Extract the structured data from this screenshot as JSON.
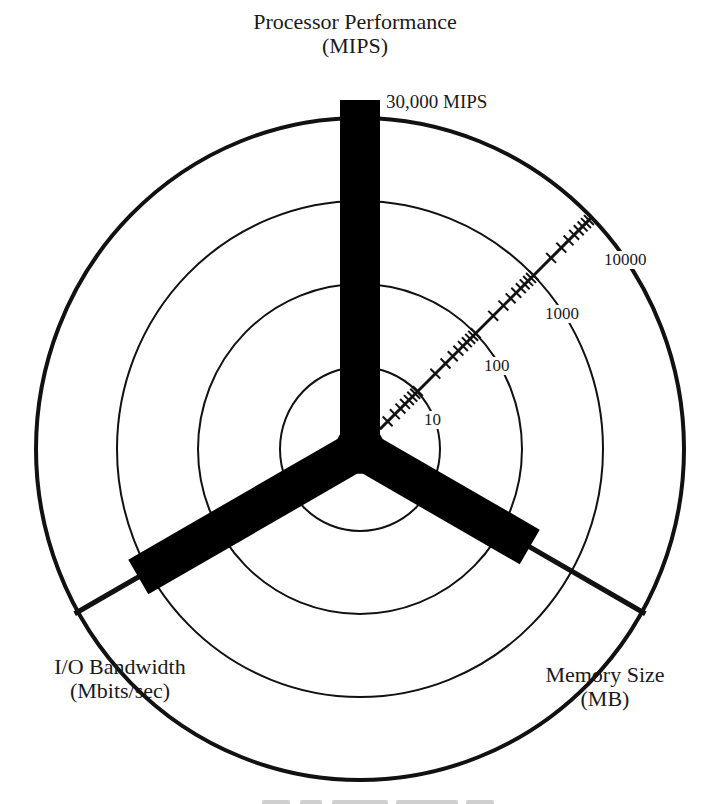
{
  "figure": {
    "title_line1": "Processor Performance",
    "title_line2": "(MIPS)",
    "processor_max_label": "30,000 MIPS",
    "io_label_line1": "I/O Bandwidth",
    "io_label_line2": "(Mbits/sec)",
    "memory_label_line1": "Memory Size",
    "memory_label_line2": "(MB)",
    "caption_visible": false
  },
  "chart_data": {
    "type": "radar",
    "scale": "logarithmic",
    "rings": [
      {
        "value": 10,
        "label": "10"
      },
      {
        "value": 100,
        "label": "100"
      },
      {
        "value": 1000,
        "label": "1000"
      },
      {
        "value": 10000,
        "label": "10000"
      }
    ],
    "axes": [
      {
        "name": "Processor Performance",
        "unit": "MIPS",
        "angle_deg": 90,
        "value": 30000,
        "annotation": "30,000 MIPS"
      },
      {
        "name": "Memory Size",
        "unit": "MB",
        "angle_deg": -30,
        "value": 250
      },
      {
        "name": "I/O Bandwidth",
        "unit": "Mbits/sec",
        "angle_deg": 210,
        "value": 1400
      }
    ],
    "log_scale_axis": {
      "angle_deg": 45,
      "from": 1,
      "to": 10000,
      "decade_labels": [
        "10",
        "100",
        "1000",
        "10000"
      ]
    },
    "geometry": {
      "cx": 360,
      "cy": 449,
      "ring_rx": [
        80,
        162,
        243,
        324
      ],
      "ring_ry": [
        82,
        165,
        248,
        331
      ],
      "bar_width": 40,
      "bar_lengths": {
        "processor": 349,
        "memory": 196,
        "io": 256
      }
    }
  }
}
